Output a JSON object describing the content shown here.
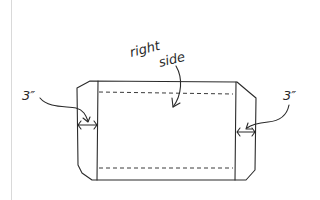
{
  "diagram": {
    "type": "sewing-pattern-sketch",
    "labels": {
      "center_line1": "right",
      "center_line2": "side",
      "left_measure": "3″",
      "right_measure": "3″"
    },
    "colors": {
      "ink": "#2a2a2a",
      "background": "#ffffff",
      "margin_line": "#d9d9d9"
    }
  }
}
